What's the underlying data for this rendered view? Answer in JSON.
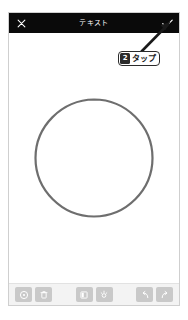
{
  "app": {
    "screen_background": "#ffffff",
    "frame_border_color": "#cfcfcf"
  },
  "appbar": {
    "background": "#0a0a0a",
    "foreground": "#ffffff",
    "title": "テキスト",
    "close_icon": "close-x-icon",
    "confirm_icon": "checkmark-icon"
  },
  "canvas": {
    "shape": "hand-drawn-circle",
    "stroke_color": "#6e6e6e",
    "background": "#ffffff"
  },
  "toolbar": {
    "background": "#f3f3f3",
    "button_color": "#c9c9c9",
    "glyph_color": "#ffffff",
    "items": [
      {
        "name": "color-picker-button",
        "icon": "color-circle-icon"
      },
      {
        "name": "delete-button",
        "icon": "trash-icon"
      },
      {
        "name": "contrast-button",
        "icon": "half-filled-square-icon"
      },
      {
        "name": "brightness-button",
        "icon": "brightness-icon"
      },
      {
        "name": "undo-button",
        "icon": "undo-arrow-icon"
      },
      {
        "name": "redo-button",
        "icon": "redo-arrow-icon"
      }
    ]
  },
  "annotation": {
    "step_number": "2",
    "label": "タップ",
    "arrow": "arrow-pointing-to-confirm",
    "badge_border": "#2b2b2b",
    "badge_background": "#ffffff"
  }
}
